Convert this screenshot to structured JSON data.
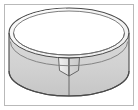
{
  "figure": {
    "title": "Cut cylindrical band",
    "caption": "",
    "alt_text": "A three-dimensional ring-shaped band drawn in perspective, cut open at the front so the two cut ends flare apart into a bowtie-shaped notch",
    "shape_name": "cylindrical band with a front cut",
    "view": "perspective from slightly above",
    "frame": {
      "border_color": "#b9b9b9",
      "border_width_px": 1,
      "background_color": "#ffffff",
      "inset_px": 4
    },
    "palette": {
      "outline": "#4a4a4a",
      "outline_soft": "#8d8d8d",
      "front_wall_fill": "#d2d2d2",
      "inner_wall_fill": "#ededed",
      "top_rim_fill": "#f4f4f4",
      "flap_left_fill": "#e4e4e4",
      "flap_right_fill": "#cfcfcf",
      "highlight": "#fbfbfb",
      "background": "#ffffff"
    },
    "geometry": {
      "canvas_width": 138,
      "canvas_height": 110,
      "center_x": 69,
      "top_ellipse_center_y": 33,
      "top_ellipse_rx": 60,
      "top_ellipse_ry": 25,
      "band_height": 38,
      "wall_thickness": 4,
      "cut_x": 69,
      "cut_top_y": 58,
      "cut_bottom_y": 96,
      "flap_spread": 11
    },
    "parts": [
      {
        "id": "top-rim",
        "label": "top rim of band"
      },
      {
        "id": "outer-wall",
        "label": "outer wall (front, shaded)"
      },
      {
        "id": "inner-wall",
        "label": "inner wall (back, visible through opening)"
      },
      {
        "id": "cut-flap-left",
        "label": "left cut end"
      },
      {
        "id": "cut-flap-right",
        "label": "right cut end"
      },
      {
        "id": "bottom-edge",
        "label": "bottom edge of band"
      }
    ]
  }
}
